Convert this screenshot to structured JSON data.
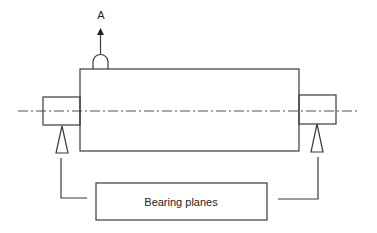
{
  "diagram": {
    "probe_label": "A",
    "bearing_label": "Bearing planes",
    "colors": {
      "stroke": "#3a3a3a",
      "text": "#222222",
      "background": "#ffffff"
    }
  }
}
